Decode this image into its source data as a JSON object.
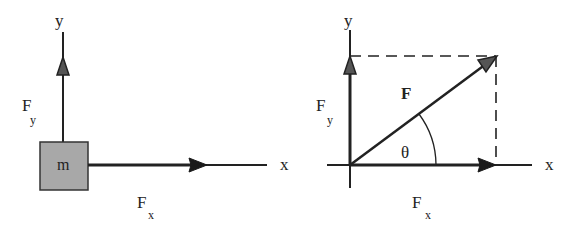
{
  "left_panel": {
    "axis_x_label": "x",
    "axis_y_label": "y",
    "mass_label": "m",
    "force_x": {
      "symbol": "F",
      "subscript": "x"
    },
    "force_y": {
      "symbol": "F",
      "subscript": "y"
    }
  },
  "right_panel": {
    "axis_x_label": "x",
    "axis_y_label": "y",
    "force_label": "F",
    "angle_label": "θ",
    "force_x": {
      "symbol": "F",
      "subscript": "x"
    },
    "force_y": {
      "symbol": "F",
      "subscript": "y"
    }
  },
  "colors": {
    "stroke": "#222222",
    "mass_fill": "#a8a8a8",
    "arrow_fill": "#1a1a1a"
  }
}
